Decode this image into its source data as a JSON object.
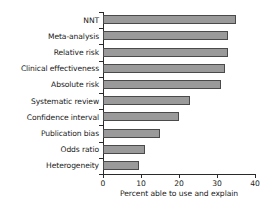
{
  "chart_data": {
    "type": "bar",
    "orientation": "horizontal",
    "title": "",
    "xlabel": "Percent able to use and explain",
    "ylabel": "",
    "xlim": [
      0,
      40
    ],
    "xticks": [
      0,
      10,
      20,
      30,
      40
    ],
    "xtick_labels": [
      "0",
      "10",
      "20",
      "30",
      "40"
    ],
    "grid": false,
    "legend": false,
    "categories": [
      "NNT",
      "Meta-analysis",
      "Relative risk",
      "Clinical effectiveness",
      "Absolute risk",
      "Systematic review",
      "Confidence interval",
      "Publication bias",
      "Odds ratio",
      "Heterogeneity"
    ],
    "values": [
      35,
      33,
      33,
      32,
      31,
      23,
      20,
      15,
      11,
      9.5
    ],
    "bar_color": "#9a9a9a",
    "bar_edge_color": "#4a4a4a",
    "axis_color": "#2a2a2a",
    "background_color": "#ffffff"
  }
}
